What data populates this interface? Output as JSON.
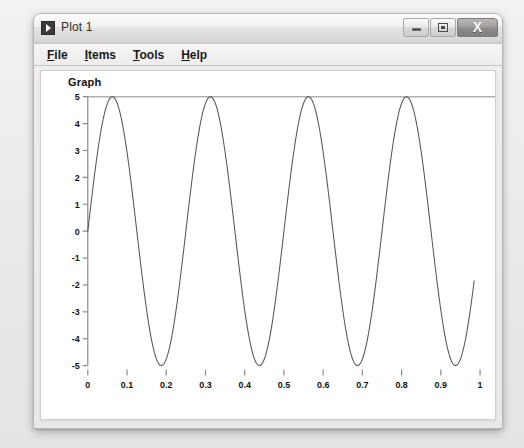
{
  "window": {
    "title": "Plot 1",
    "icon": "plot-app-icon",
    "controls": [
      {
        "name": "minimize-button",
        "glyph": "minimize-icon",
        "label": ""
      },
      {
        "name": "restore-button",
        "glyph": "restore-icon",
        "label": ""
      },
      {
        "name": "close-button",
        "glyph": "close-icon",
        "label": "X"
      }
    ]
  },
  "menubar": {
    "items": [
      {
        "name": "menu-file",
        "mnemonic": "F",
        "rest": "ile"
      },
      {
        "name": "menu-items",
        "mnemonic": "I",
        "rest": "tems"
      },
      {
        "name": "menu-tools",
        "mnemonic": "T",
        "rest": "ools"
      },
      {
        "name": "menu-help",
        "mnemonic": "H",
        "rest": "elp"
      }
    ]
  },
  "chart_data": {
    "type": "line",
    "title": "Graph",
    "xlabel": "",
    "ylabel": "",
    "xlim": [
      0,
      1
    ],
    "ylim": [
      -5,
      5
    ],
    "grid": false,
    "legend": null,
    "xticks": [
      "0",
      "0.1",
      "0.2",
      "0.3",
      "0.4",
      "0.5",
      "0.6",
      "0.7",
      "0.8",
      "0.9",
      "1"
    ],
    "xtick_values": [
      0,
      0.1,
      0.2,
      0.3,
      0.4,
      0.5,
      0.6,
      0.7,
      0.8,
      0.9,
      1
    ],
    "yticks": [
      "5",
      "4",
      "3",
      "2",
      "1",
      "0",
      "-1",
      "-2",
      "-3",
      "-4",
      "-5"
    ],
    "ytick_values": [
      5,
      4,
      3,
      2,
      1,
      0,
      -1,
      -2,
      -3,
      -4,
      -5
    ],
    "series": [
      {
        "name": "sine",
        "color": "#555555",
        "formula": "5*sin(8*pi*x)",
        "amplitude": 5,
        "frequency_hz": 4,
        "phase": 0,
        "x_start": 0,
        "x_end": 0.985,
        "samples": 400,
        "peaks_x": [
          0.0625,
          0.3125,
          0.5625,
          0.8125
        ],
        "peaks_y": [
          5,
          5,
          5,
          5
        ],
        "troughs_x": [
          0.1875,
          0.4375,
          0.6875,
          0.9375
        ],
        "troughs_y": [
          -5,
          -5,
          -5,
          -5
        ],
        "end_value": -1.51
      }
    ]
  },
  "colors": {
    "plot_background": "#ffffff",
    "curve": "#555555",
    "axis": "#8a8a8a",
    "frame_top": "#b0b0b0",
    "window_chrome": "#e9e8e6",
    "text": "#111111"
  }
}
